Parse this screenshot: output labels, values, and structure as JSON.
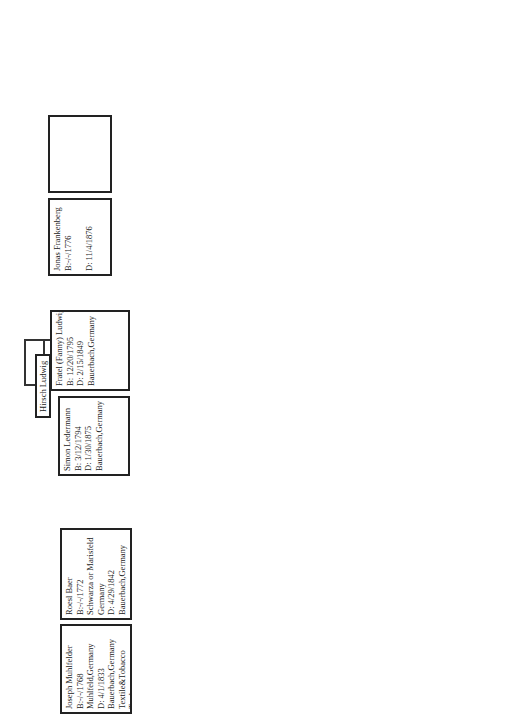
{
  "people": {
    "hirsch_ludwig": {
      "lines": [
        "Hirsch Ludwig"
      ]
    },
    "joseph_muhlfelder": {
      "lines": [
        "Joseph Muhlfelder",
        "B:-/-/1768",
        "Muhlfeld,Germany",
        "D: 4/1/1833",
        "Bauerbach,Germany",
        "Textile&Tobacco",
        "Trader"
      ]
    },
    "roesl_baer": {
      "lines": [
        "Roesl Baer",
        "B:-/-/1772",
        "Schwarza or Marisfeld",
        "Germany",
        "D: 4/29/1842",
        "Bauerbach,Germany"
      ]
    },
    "simon_ledermann": {
      "lines": [
        "Simon Ledermann",
        "B: 3/12/1794",
        "D: 1/30/1875",
        "Bauerbach,Germany"
      ]
    },
    "fratel_ludwig": {
      "lines": [
        "Fratel (Fanny) Ludwig",
        "B: 12/20/1795",
        "",
        "D: 2/15/1849",
        "Bauerbach,Germany"
      ]
    },
    "jonas_frankenberg": {
      "lines": [
        "Jonas Frankenberg",
        "B:-/-/1776",
        "",
        "D: 11/4/1876"
      ]
    },
    "unknown_frankenberg_spouse": {
      "lines": []
    },
    "hermann": {
      "lines": [
        "---- Hermann"
      ]
    },
    "regina": {
      "lines": [
        "Regina",
        "B:",
        "Heinrichs,Germany"
      ]
    },
    "moses_muhlfelder": {
      "lines": [
        "Moses Muhlfelder",
        "B: 3/23/1813",
        "Bauerbach,Germany",
        "D: 8/14/1893",
        "Bauerbach,Germany",
        "Shoemaker"
      ]
    },
    "minna_ledermann": {
      "lines": [
        "Minna Ledermann",
        "B: 11/18/1826",
        "Bauerbach,Germ.",
        "D: 4/10/1908",
        "Reyenbach,Germ."
      ]
    },
    "loeb_frankenberg": {
      "lines": [
        "Loeb Frankenberg",
        "B: 04/16/1816",
        "Marisfeld,Germany",
        "D: 10/09/1894",
        "Themar,Germany",
        "TextileDealer"
      ]
    },
    "jette_hermann": {
      "lines": [
        "Jette Hermann",
        "B: 03/24/1826",
        "Heinrichs,Germany",
        "D: 07/23/1903",
        "Themar,Germany"
      ]
    },
    "jonas_muhlfelder": {
      "lines": [
        "Jonas Muhlfelder",
        "B: 08/17/1863",
        "Bauerbach,Germany",
        "D: 11/02/37",
        "Suhl,Germany",
        "Tailor"
      ]
    },
    "amalie_frankenberg": {
      "lines": [
        "Amalie Frankenberg",
        "B: 06/11/1862",
        "Marisfeld,Germany",
        "D: 12/18/1931",
        "Meiningen,Germany",
        "Tailor"
      ]
    },
    "julius_muhlfelder": {
      "lines": [
        "Julius Muhlfelder",
        "B: 12/18/1891",
        "Themar,Germany",
        "D:09/06/1976",
        "Livingston,NJ",
        "Leather Expert&Dealer"
      ]
    }
  },
  "marriages": {
    "m1": {
      "marriage": "M: 1793",
      "children_count": "C: 8",
      "place": [
        "Bauerbach",
        "Germany"
      ],
      "siblings": [
        [
          "Jonas",
          "Michael",
          "Jakob"
        ],
        [
          "Hirsch",
          "Susanne Frank",
          "Hannah Eisemann",
          "Sarah Sander"
        ]
      ]
    },
    "m2": {
      "marriage": "M:",
      "children_count": "C: ?",
      "place": [
        "Bauerbach",
        "Germany"
      ]
    },
    "m3": {
      "marriage": "M: 06/-/1848",
      "children_count": "C7",
      "place": [
        "Themar,Germany"
      ],
      "siblings": [
        [
          "Nathan",
          "Samuel",
          "Louis"
        ],
        [
          "Meta Krakauer",
          "Sarah",
          "Emma Wertheimer"
        ]
      ]
    },
    "m4": {
      "marriage": "M: 12/22/1852",
      "children_count": "C: 5",
      "place": [
        "Bauerbach(2nd marr)"
      ],
      "siblings": [
        [
          "Jakob",
          "Fanni Blatt",
          "Louis",
          "Maier"
        ]
      ]
    },
    "m5": {
      "marriage": "M: 11/10/1890",
      "children_count": "C: 3",
      "place": [
        "Themar,Germany"
      ],
      "siblings": [
        [
          "Lothar",
          "Max"
        ]
      ]
    }
  }
}
